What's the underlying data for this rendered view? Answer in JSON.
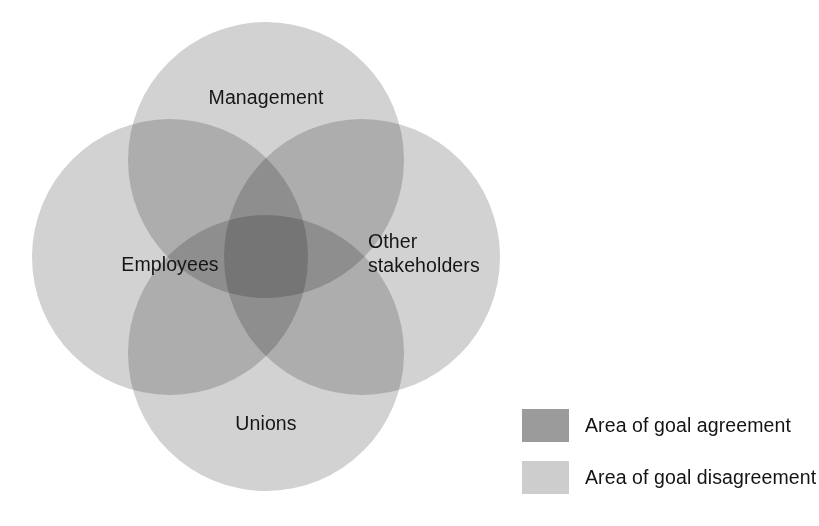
{
  "chart_data": {
    "type": "diagram",
    "diagram_kind": "venn",
    "title": "",
    "sets": [
      {
        "id": "management",
        "label": "Management",
        "position": "top",
        "cx": 266,
        "cy": 160,
        "r": 138
      },
      {
        "id": "employees",
        "label": "Employees",
        "position": "left",
        "cx": 170,
        "cy": 257,
        "r": 138
      },
      {
        "id": "other_stakeholders",
        "label": "Other\nstakeholders",
        "position": "right",
        "cx": 362,
        "cy": 257,
        "r": 138
      },
      {
        "id": "unions",
        "label": "Unions",
        "position": "bottom",
        "cx": 266,
        "cy": 353,
        "r": 138
      }
    ],
    "regions": [
      {
        "name": "single set only",
        "overlap_count": 1,
        "meaning": "Area of goal disagreement",
        "color": "#d2d2d2"
      },
      {
        "name": "two-set overlap",
        "overlap_count": 2,
        "meaning": "partial overlap",
        "color": "#a9a9a9"
      },
      {
        "name": "three-set overlap",
        "overlap_count": 3,
        "meaning": "partial overlap",
        "color": "#6f6f6f"
      },
      {
        "name": "all four overlap",
        "overlap_count": 4,
        "meaning": "Area of goal agreement",
        "color": "#2d2d2d"
      }
    ],
    "legend_position": "bottom-right"
  },
  "venn": {
    "labels": {
      "management": "Management",
      "employees": "Employees",
      "other_stakeholders": "Other\nstakeholders",
      "unions": "Unions"
    },
    "fill_color": "#d2d2d2"
  },
  "legend": {
    "items": [
      {
        "label": "Area of goal agreement",
        "color": "#9b9b9b"
      },
      {
        "label": "Area of goal disagreement",
        "color": "#cdcdcd"
      }
    ]
  }
}
